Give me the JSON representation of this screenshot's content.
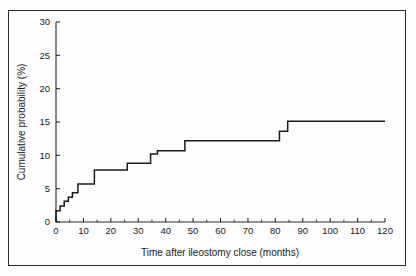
{
  "chart_data": {
    "type": "line",
    "subtype": "kaplan-meier-step",
    "title": "",
    "xlabel": "Time after ileostomy close (months)",
    "ylabel": "Cumulative probability (%)",
    "xlim": [
      0,
      120
    ],
    "ylim": [
      0,
      30
    ],
    "xticks": [
      0,
      10,
      20,
      30,
      40,
      50,
      60,
      70,
      80,
      90,
      100,
      110,
      120
    ],
    "xtick_labels": [
      "0",
      "10",
      "20",
      "30",
      "40",
      "50",
      "60",
      "70",
      "80",
      "90",
      "100",
      "110",
      "120"
    ],
    "xminor_interval": 5,
    "yticks": [
      0,
      5,
      10,
      15,
      20,
      25,
      30
    ],
    "ytick_labels": [
      "0",
      "5",
      "10",
      "15",
      "20",
      "25",
      "30"
    ],
    "grid": false,
    "legend": null,
    "series": [
      {
        "name": "Cumulative probability of recurrence",
        "step": "post",
        "x": [
          0,
          0,
          1.5,
          3,
          4.5,
          6,
          8,
          13,
          14,
          25.5,
          26,
          34,
          34.5,
          36.5,
          37,
          46.5,
          47,
          81,
          81.5,
          84,
          84.5,
          120
        ],
        "y": [
          0,
          1.7,
          2.4,
          3.1,
          3.7,
          4.4,
          5.7,
          5.7,
          7.8,
          7.8,
          8.8,
          8.8,
          10.2,
          10.2,
          10.7,
          10.7,
          12.2,
          12.2,
          13.6,
          13.6,
          15.1,
          15.1
        ],
        "points": [
          {
            "x": 0,
            "y": 1.7
          },
          {
            "x": 1.5,
            "y": 2.4
          },
          {
            "x": 3,
            "y": 3.1
          },
          {
            "x": 4.5,
            "y": 3.7
          },
          {
            "x": 6,
            "y": 4.4
          },
          {
            "x": 8,
            "y": 5.7
          },
          {
            "x": 14,
            "y": 7.8
          },
          {
            "x": 26,
            "y": 8.8
          },
          {
            "x": 34.5,
            "y": 10.2
          },
          {
            "x": 37,
            "y": 10.7
          },
          {
            "x": 47,
            "y": 12.2
          },
          {
            "x": 81.5,
            "y": 13.6
          },
          {
            "x": 84.5,
            "y": 15.1
          },
          {
            "x": 120,
            "y": 15.1
          }
        ]
      }
    ]
  },
  "axes": {
    "x_title": "Time after ileostomy close (months)",
    "y_title": "Cumulative probability (%)"
  },
  "colors": {
    "curve": "#1a1a1a",
    "axis": "#2b2b2b",
    "border": "#2b2b2b",
    "background": "#fdfdfd"
  }
}
